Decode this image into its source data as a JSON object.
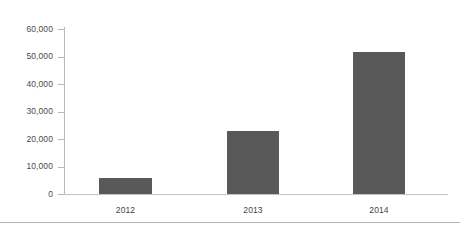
{
  "chart_data": {
    "type": "bar",
    "title": "",
    "subtitle": "",
    "xlabel": "",
    "ylabel": "",
    "categories": [
      "2012",
      "2013",
      "2014"
    ],
    "values": [
      5800,
      23000,
      51500
    ],
    "series": [
      {
        "name": "",
        "values": [
          5800,
          23000,
          51500
        ]
      }
    ],
    "ylim": [
      0,
      60000
    ],
    "yticks": [
      0,
      10000,
      20000,
      30000,
      40000,
      50000,
      60000
    ],
    "ytick_labels": [
      "0",
      "10,000",
      "20,000",
      "30,000",
      "40,000",
      "50,000",
      "60,000"
    ],
    "xtick_labels": [
      "2012",
      "2013",
      "2014"
    ],
    "grid": false,
    "legend": false,
    "legend_position": "none",
    "annotations": [],
    "colors": {
      "bar": "#595959",
      "axis": "#b9b9b9",
      "axis_baseline": "#c2c2c2",
      "tick_text": "#4a4a4a",
      "category_text": "#3f3f3f",
      "background": "#ffffff",
      "bottom_rule": "#b5b5b5"
    }
  }
}
